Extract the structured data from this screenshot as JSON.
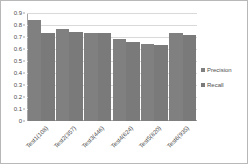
{
  "chart_data": {
    "type": "bar",
    "title": "",
    "subtitle": "",
    "xlabel": "",
    "ylabel": "",
    "ylim": [
      0,
      0.9
    ],
    "ytick_step": 0.1,
    "yticks": [
      "0.9",
      "0.8",
      "0.7",
      "0.6",
      "0.5",
      "0.4",
      "0.3",
      "0.2",
      "0.1",
      "0"
    ],
    "ytick_values": [
      0.9,
      0.8,
      0.7,
      0.6,
      0.5,
      0.4,
      0.3,
      0.2,
      0.1,
      0
    ],
    "grid": true,
    "legend_position": "right",
    "categories": [
      "Test1(108)",
      "Test2(357)",
      "Test3(446)",
      "Test4(624)",
      "Test5(820)",
      "Test6(935)"
    ],
    "series": [
      {
        "name": "Precision",
        "color": "#808080",
        "values": [
          0.84,
          0.77,
          0.73,
          0.68,
          0.645,
          0.735
        ]
      },
      {
        "name": "Recall",
        "color": "#7a7a7a",
        "values": [
          0.735,
          0.74,
          0.73,
          0.655,
          0.63,
          0.72
        ]
      }
    ]
  },
  "legend": {
    "items": [
      {
        "label": "Precision",
        "color": "#808080"
      },
      {
        "label": "Recall",
        "color": "#7a7a7a"
      }
    ]
  },
  "colors": {
    "bar_precision": "#808080",
    "bar_recall": "#7a7a7a",
    "gridline": "#d9d9d9",
    "axis": "#a6a6a6",
    "text": "#4d4d4d",
    "border": "#b8b8b8",
    "background": "#ffffff"
  }
}
